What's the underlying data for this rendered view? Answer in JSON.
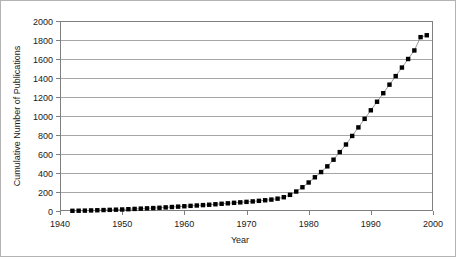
{
  "chart_data": {
    "type": "scatter",
    "title": "",
    "subtitle": "",
    "xlabel": "Year",
    "ylabel": "Cumulative Number of Publications",
    "xlim": [
      1940,
      2000
    ],
    "ylim": [
      0,
      2000
    ],
    "xticks": [
      1940,
      1950,
      1960,
      1970,
      1980,
      1990,
      2000
    ],
    "yticks": [
      0,
      200,
      400,
      600,
      800,
      1000,
      1200,
      1400,
      1600,
      1800,
      2000
    ],
    "xtick_labels": [
      "1940",
      "1950",
      "1960",
      "1970",
      "1980",
      "1990",
      "2000"
    ],
    "ytick_labels": [
      "0",
      "200",
      "400",
      "600",
      "800",
      "1000",
      "1200",
      "1400",
      "1600",
      "1800",
      "2000"
    ],
    "grid": "horizontal",
    "legend": "none",
    "marker": "filled-square",
    "marker_color": "#000000",
    "line_color": "#808080",
    "series": [
      {
        "name": "Cumulative Number of Publications",
        "x": [
          1942,
          1943,
          1944,
          1945,
          1946,
          1947,
          1948,
          1949,
          1950,
          1951,
          1952,
          1953,
          1954,
          1955,
          1956,
          1957,
          1958,
          1959,
          1960,
          1961,
          1962,
          1963,
          1964,
          1965,
          1966,
          1967,
          1968,
          1969,
          1970,
          1971,
          1972,
          1973,
          1974,
          1975,
          1976,
          1977,
          1978,
          1979,
          1980,
          1981,
          1982,
          1983,
          1984,
          1985,
          1986,
          1987,
          1988,
          1989,
          1990,
          1991,
          1992,
          1993,
          1994,
          1995,
          1996,
          1997,
          1998,
          1999
        ],
        "values": [
          2,
          3,
          4,
          6,
          8,
          10,
          12,
          14,
          16,
          19,
          22,
          25,
          28,
          31,
          34,
          38,
          42,
          46,
          50,
          54,
          58,
          62,
          66,
          71,
          76,
          81,
          86,
          91,
          96,
          101,
          107,
          113,
          120,
          130,
          145,
          170,
          205,
          250,
          300,
          355,
          410,
          470,
          540,
          620,
          700,
          790,
          880,
          970,
          1060,
          1150,
          1240,
          1330,
          1420,
          1510,
          1600,
          1690,
          1830,
          1850
        ]
      }
    ]
  },
  "figure": {
    "border_color": "#b3b3b3",
    "plot_frame_color": "#808080",
    "gridline_color": "#a6a6a6",
    "background": "#ffffff"
  }
}
